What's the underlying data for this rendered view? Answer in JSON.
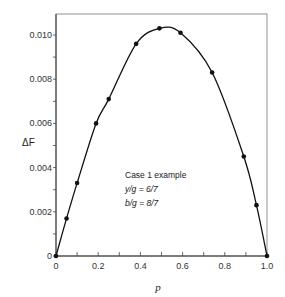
{
  "chart_data": {
    "type": "line",
    "title": "",
    "xlabel": "p",
    "ylabel": "ΔF",
    "xlim": [
      0,
      1.0
    ],
    "ylim": [
      0,
      0.011
    ],
    "grid": false,
    "legend": null,
    "x_ticks": [
      "0",
      "0.2",
      "0.4",
      "0.6",
      "0.8",
      "1.0"
    ],
    "y_ticks": [
      "0",
      "0.002",
      "0.004",
      "0.006",
      "0.008",
      "0.010"
    ],
    "series": [
      {
        "name": "ΔF",
        "marker": "circle",
        "line": "smooth",
        "x": [
          0,
          0.05,
          0.1,
          0.19,
          0.25,
          0.38,
          0.49,
          0.59,
          0.74,
          0.89,
          0.95,
          1.0
        ],
        "y": [
          0,
          0.0017,
          0.0033,
          0.006,
          0.0071,
          0.0096,
          0.0103,
          0.0101,
          0.0083,
          0.0045,
          0.0023,
          0
        ]
      }
    ],
    "annotations": [
      "Case 1 example",
      "y/g = 6/7",
      "b/g = 8/7"
    ]
  },
  "annotation": {
    "line1": "Case 1 example",
    "line2": "y/g = 6/7",
    "line3": "b/g = 8/7"
  },
  "colors": {
    "line": "#111111",
    "axis": "#555555",
    "marker": "#111111"
  }
}
